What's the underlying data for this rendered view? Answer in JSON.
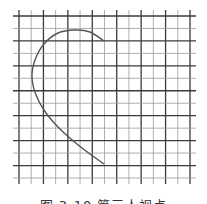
{
  "figure": {
    "type": "grid-curve-diagram",
    "grid": {
      "x_start": 19,
      "x_end": 190,
      "columns": 14,
      "y_start": 16,
      "y_end": 178,
      "rows": 13,
      "line_color": "#3a3a3a",
      "minor_line_color": "#9a9a9a"
    },
    "curve": {
      "color": "#555555",
      "points": [
        [
          104,
          41
        ],
        [
          90,
          32
        ],
        [
          75,
          30
        ],
        [
          58,
          33
        ],
        [
          44,
          44
        ],
        [
          35,
          60
        ],
        [
          32,
          77
        ],
        [
          36,
          95
        ],
        [
          46,
          113
        ],
        [
          62,
          131
        ],
        [
          82,
          148
        ],
        [
          104,
          164
        ]
      ]
    }
  },
  "caption": {
    "text": "图 3-10  第三人视点"
  }
}
